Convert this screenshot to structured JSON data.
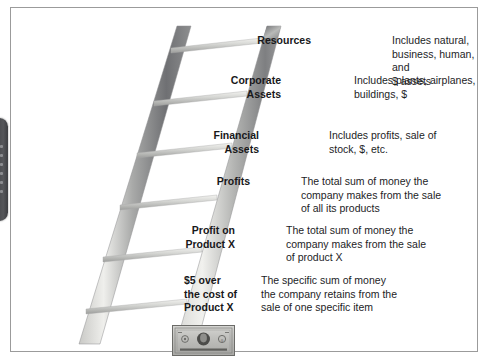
{
  "panel": {
    "border_color": "#9b9b9b",
    "background": "#ffffff"
  },
  "handle": {
    "name": "drag-handle",
    "color": "#48494d"
  },
  "graphic": {
    "ladder": {
      "name": "ladder-illustration",
      "rail_color_light": "#d8d8d6",
      "rail_color_dark": "#6f7073",
      "rung_count": 6
    },
    "money": {
      "name": "dollar-bill-image",
      "caption": "$",
      "color": "#9a9a98"
    }
  },
  "rows": [
    {
      "label": "Resources",
      "desc": "Includes natural, business, human, and $ assets",
      "desc_lines": [
        "Includes natural,",
        "business, human, and",
        "$ assets"
      ]
    },
    {
      "label": "Corporate Assets",
      "label_lines": [
        "Corporate",
        "Assets"
      ],
      "desc": "Includes plants, airplanes, buildings, $",
      "desc_lines": [
        "Includes plants, airplanes,",
        "buildings, $"
      ]
    },
    {
      "label": "Financial Assets",
      "label_lines": [
        "Financial",
        "Assets"
      ],
      "desc": "Includes profits, sale of stock, $, etc.",
      "desc_lines": [
        "Includes profits, sale of",
        "stock, $, etc."
      ]
    },
    {
      "label": "Profits",
      "label_lines": [
        "Profits"
      ],
      "desc": "The total sum of money the company makes from the sale of all its products",
      "desc_lines": [
        "The total sum of money the",
        "company makes from the sale",
        "of all its products"
      ]
    },
    {
      "label": "Profit on Product X",
      "label_lines": [
        "Profit on",
        "Product X"
      ],
      "desc": "The total sum of money the company makes from the sale of product X",
      "desc_lines": [
        "The total sum of money the",
        "company makes from the sale",
        "of product X"
      ]
    },
    {
      "label": "$5 over the cost of Product X",
      "label_lines": [
        "$5 over",
        "the cost of",
        "Product X"
      ],
      "desc": "The specific sum of money the company retains from the sale of one specific item",
      "desc_lines": [
        "The specific sum of money",
        "the company retains from the",
        "sale of one specific item"
      ]
    }
  ]
}
